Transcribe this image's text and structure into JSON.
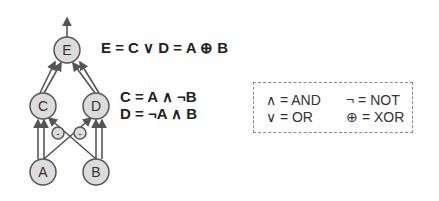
{
  "diagram": {
    "nodes": [
      {
        "id": "E",
        "label": "E"
      },
      {
        "id": "C",
        "label": "C"
      },
      {
        "id": "D",
        "label": "D"
      },
      {
        "id": "A",
        "label": "A"
      },
      {
        "id": "B",
        "label": "B"
      }
    ],
    "negation_label": "-",
    "equations": {
      "e": "E = C ∨ D = A ⊕ B",
      "c": "C = A ∧ ¬B",
      "d": "D = ¬A ∧ B"
    },
    "legend": {
      "and": "∧ = AND",
      "or": "∨ = OR",
      "not": "¬  = NOT",
      "xor": "⊕  = XOR"
    },
    "colors": {
      "node_fill": "#dcdcdc",
      "stroke": "#555555"
    }
  }
}
